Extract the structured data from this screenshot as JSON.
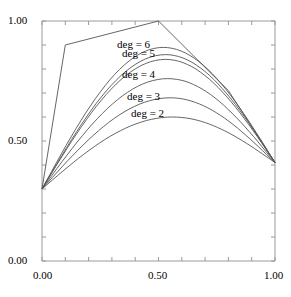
{
  "chart_data": {
    "type": "line",
    "title": "",
    "xlabel": "",
    "ylabel": "",
    "xlim": [
      0.0,
      1.0
    ],
    "ylim": [
      0.0,
      1.0
    ],
    "grid": false,
    "legend": "inline labels",
    "x_ticks": [
      "0.00",
      "0.50",
      "1.00"
    ],
    "y_ticks": [
      "0.00",
      "0.50",
      "1.00"
    ],
    "x_minor_tick_step": 0.1,
    "y_minor_tick_step": 0.1,
    "control_polygon": {
      "name": "control polygon",
      "x": [
        0.0,
        0.1,
        0.5,
        0.8,
        1.0
      ],
      "y": [
        0.3,
        0.9,
        1.0,
        0.71,
        0.41
      ]
    },
    "series": [
      {
        "name": "deg = 6",
        "label": "deg = 6",
        "peak": [
          0.52,
          0.89
        ]
      },
      {
        "name": "deg = 5",
        "label": "deg = 5",
        "peak": [
          0.53,
          0.86
        ]
      },
      {
        "name": "unlabeled",
        "label": "",
        "peak": [
          0.53,
          0.84
        ]
      },
      {
        "name": "deg = 4",
        "label": "deg = 4",
        "peak": [
          0.54,
          0.76
        ]
      },
      {
        "name": "deg = 3",
        "label": "deg = 3",
        "peak": [
          0.55,
          0.68
        ]
      },
      {
        "name": "deg = 2",
        "label": "deg = 2",
        "peak": [
          0.56,
          0.6
        ]
      }
    ],
    "endpoints": {
      "start": [
        0.0,
        0.3
      ],
      "end": [
        1.0,
        0.41
      ]
    }
  },
  "labels": {
    "deg6": "deg = 6",
    "deg5": "deg = 5",
    "deg4": "deg = 4",
    "deg3": "deg = 3",
    "deg2": "deg = 2"
  },
  "axis": {
    "x0": "0.00",
    "x50": "0.50",
    "x100": "1.00",
    "y0": "0.00",
    "y50": "0.50",
    "y100": "1.00"
  }
}
